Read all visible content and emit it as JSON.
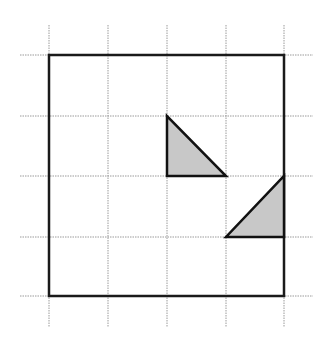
{
  "diagram": {
    "type": "grid-with-triangles",
    "grid": {
      "columns_x": [
        49,
        108,
        167,
        226,
        284
      ],
      "rows_y": [
        55,
        116,
        176,
        237,
        296
      ],
      "h_line_extent": [
        20,
        313
      ],
      "v_line_extent": [
        25,
        327
      ],
      "line_color": "#9a9a9a",
      "style": "dotted"
    },
    "square": {
      "x": 49,
      "y": 55,
      "width": 235,
      "height": 241,
      "stroke": "#1a1a1a",
      "stroke_width": 2.5
    },
    "triangles": [
      {
        "name": "upper-triangle",
        "points": [
          [
            167,
            116
          ],
          [
            167,
            176
          ],
          [
            226,
            176
          ]
        ],
        "fill": "#c8c8c8",
        "stroke": "#111111"
      },
      {
        "name": "lower-triangle",
        "points": [
          [
            284,
            176
          ],
          [
            284,
            237
          ],
          [
            226,
            237
          ]
        ],
        "fill": "#c8c8c8",
        "stroke": "#111111"
      }
    ]
  }
}
